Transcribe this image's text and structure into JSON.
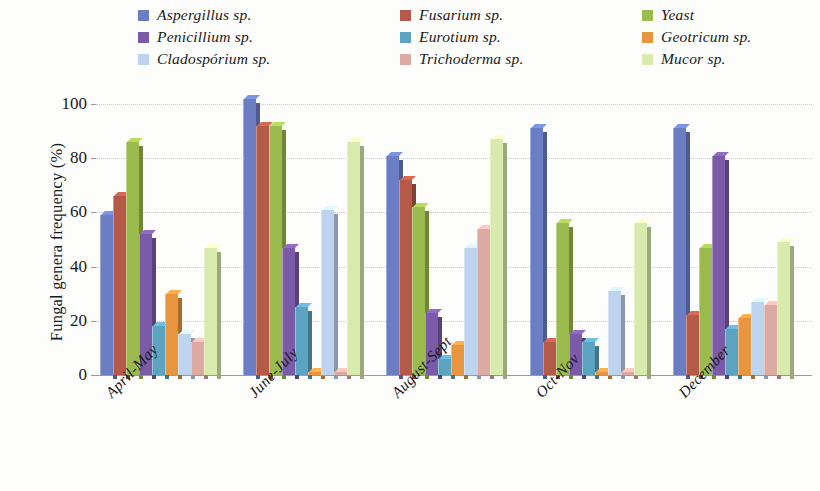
{
  "chart_data": {
    "type": "bar",
    "title": "",
    "subtitle": "",
    "xlabel": "",
    "ylabel": "Fungal genera frequency (%)",
    "ylim": [
      0,
      100
    ],
    "yticks": [
      0,
      20,
      40,
      60,
      80,
      100
    ],
    "ytick_labels": [
      "0",
      "20",
      "40",
      "60",
      "80",
      "100"
    ],
    "grid": true,
    "legend_position": "top",
    "legend_columns": 3,
    "categories": [
      "April-May",
      "June-July",
      "August-Sept",
      "Oct-Nov",
      "December"
    ],
    "series": [
      {
        "name": "Aspergillus sp.",
        "color": "#6b7ec4",
        "values": [
          59,
          102,
          81,
          91,
          91
        ]
      },
      {
        "name": "Fusarium sp.",
        "color": "#b55a49",
        "values": [
          66,
          92,
          72,
          12,
          22
        ]
      },
      {
        "name": "Yeast",
        "color": "#9cbb4f",
        "values": [
          86,
          92,
          62,
          56,
          47
        ]
      },
      {
        "name": "Penicillium sp.",
        "color": "#7b5ba8",
        "values": [
          52,
          47,
          23,
          15,
          81
        ]
      },
      {
        "name": "Eurotium sp.",
        "color": "#5ba3c0",
        "values": [
          18,
          25,
          6,
          12,
          17
        ]
      },
      {
        "name": "Geotricum sp.",
        "color": "#e8953f",
        "values": [
          30,
          1,
          11,
          1,
          21
        ]
      },
      {
        "name": "Cladospórium sp.",
        "color": "#bed3ed",
        "values": [
          15,
          61,
          47,
          31,
          27
        ]
      },
      {
        "name": "Trichoderma sp.",
        "color": "#ddaaa3",
        "values": [
          12,
          1,
          54,
          1,
          26
        ]
      },
      {
        "name": "Mucor sp.",
        "color": "#d9ebac",
        "values": [
          47,
          86,
          87,
          56,
          49
        ]
      }
    ],
    "legend_order": [
      "Aspergillus sp.",
      "Fusarium sp.",
      "Yeast",
      "Penicillium sp.",
      "Eurotium sp.",
      "Geotricum sp.",
      "Cladospórium sp.",
      "Trichoderma sp.",
      "Mucor sp."
    ]
  }
}
